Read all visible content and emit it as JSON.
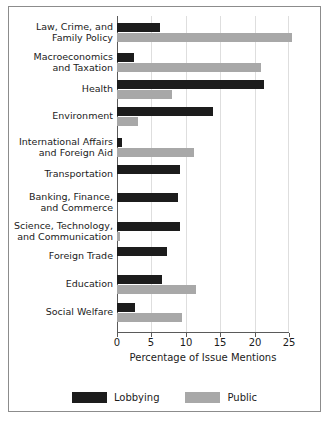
{
  "chart_data": {
    "type": "bar",
    "orientation": "horizontal",
    "title": "",
    "xlabel": "Percentage of Issue Mentions",
    "ylabel": "",
    "xlim": [
      0,
      25
    ],
    "xticks": [
      0,
      5,
      10,
      15,
      20,
      25
    ],
    "xticklabels": [
      "0",
      "5",
      "10",
      "15",
      "20",
      "25"
    ],
    "grid": true,
    "grid_axis": "x",
    "legend_position": "bottom",
    "categories": [
      "Law, Crime, and\nFamily Policy",
      "Macroeconomics\nand Taxation",
      "Health",
      "Environment",
      "International Affairs\nand Foreign Aid",
      "Transportation",
      "Banking, Finance,\nand Commerce",
      "Science, Technology,\nand Communication",
      "Foreign Trade",
      "Education",
      "Social Welfare"
    ],
    "series": [
      {
        "name": "Lobbying",
        "color": "#1c1c1c",
        "values": [
          6.2,
          2.4,
          21.4,
          13.9,
          0.7,
          9.1,
          8.8,
          9.1,
          7.2,
          6.5,
          2.6
        ]
      },
      {
        "name": "Public",
        "color": "#a8a8a8",
        "values": [
          25.4,
          21.0,
          8.0,
          3.0,
          11.2,
          0.0,
          0.0,
          0.5,
          0.0,
          11.5,
          9.4
        ]
      }
    ]
  },
  "legend": {
    "items": [
      {
        "label": "Lobbying",
        "color": "#1c1c1c"
      },
      {
        "label": "Public",
        "color": "#a8a8a8"
      }
    ]
  },
  "axis": {
    "xlabel": "Percentage of Issue Mentions",
    "ticklabels": [
      "0",
      "5",
      "10",
      "15",
      "20",
      "25"
    ]
  }
}
